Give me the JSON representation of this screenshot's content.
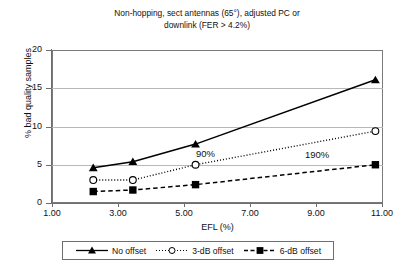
{
  "chart_data": {
    "type": "line",
    "title": "Non-hopping, sect antennas (65°), adjusted PC or downlink (FER > 4.2%)",
    "title_line1": "Non-hopping, sect antennas (65°), adjusted PC or",
    "title_line2": "downlink (FER > 4.2%)",
    "xlabel": "EFL (%)",
    "ylabel": "% bad quality samples",
    "xlim": [
      1.0,
      11.0
    ],
    "ylim": [
      0,
      20
    ],
    "xticks": [
      "1.00",
      "3.00",
      "5.00",
      "7.00",
      "9.00",
      "11.00"
    ],
    "xtick_values": [
      1.0,
      3.0,
      5.0,
      7.0,
      9.0,
      11.0
    ],
    "yticks": [
      "0",
      "5",
      "10",
      "15",
      "20"
    ],
    "ytick_values": [
      0,
      5,
      10,
      15,
      20
    ],
    "grid": true,
    "grid_axis": "y",
    "legend_position": "bottom",
    "x": [
      2.25,
      3.45,
      5.35,
      10.8
    ],
    "series": [
      {
        "name": "No offset",
        "values": [
          4.6,
          5.4,
          7.7,
          16.1
        ],
        "marker": "triangle",
        "line_style": "solid",
        "color": "#000000"
      },
      {
        "name": "3-dB offset",
        "values": [
          3.0,
          3.0,
          5.0,
          9.4
        ],
        "marker": "open-circle",
        "line_style": "dotted",
        "color": "#000000"
      },
      {
        "name": "6-dB offset",
        "values": [
          1.5,
          1.7,
          2.4,
          5.0
        ],
        "marker": "square",
        "line_style": "dashed",
        "color": "#000000"
      }
    ],
    "annotations": [
      {
        "text": "90%",
        "x": 5.6,
        "y": 6.2
      },
      {
        "text": "190%",
        "x": 9.6,
        "y": 6.1
      }
    ]
  },
  "legend": {
    "items": [
      {
        "label": "No offset"
      },
      {
        "label": "3-dB offset"
      },
      {
        "label": "6-dB offset"
      }
    ]
  }
}
